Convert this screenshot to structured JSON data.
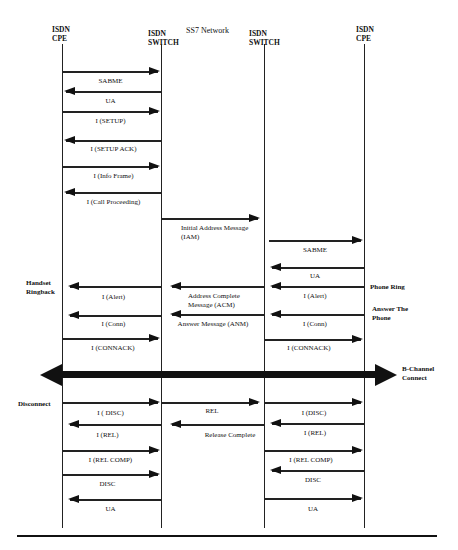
{
  "diagram": {
    "network_title": "SS7 Network",
    "entities": [
      {
        "id": "cpe-left",
        "line1": "ISDN",
        "line2": "CPE"
      },
      {
        "id": "switch-left",
        "line1": "ISDN",
        "line2": "SWITCH"
      },
      {
        "id": "switch-right",
        "line1": "ISDN",
        "line2": "SWITCH"
      },
      {
        "id": "cpe-right",
        "line1": "ISDN",
        "line2": "CPE"
      }
    ],
    "messages": [
      {
        "label": "SABME",
        "from": "cpe-left",
        "to": "switch-left"
      },
      {
        "label": "UA",
        "from": "switch-left",
        "to": "cpe-left"
      },
      {
        "label": "I (SETUP)",
        "from": "cpe-left",
        "to": "switch-left"
      },
      {
        "label": "I (SETUP ACK)",
        "from": "switch-left",
        "to": "cpe-left"
      },
      {
        "label": "I (Info Frame)",
        "from": "cpe-left",
        "to": "switch-left"
      },
      {
        "label": "I (Call Proceeding)",
        "from": "switch-left",
        "to": "cpe-left"
      },
      {
        "label": "Initial Address Message (IAM)",
        "from": "switch-left",
        "to": "switch-right"
      },
      {
        "label": "SABME",
        "from": "switch-right",
        "to": "cpe-right"
      },
      {
        "label": "UA",
        "from": "cpe-right",
        "to": "switch-right"
      },
      {
        "label": "I (Alert)",
        "from": "cpe-right",
        "to": "switch-right"
      },
      {
        "label": "Address Complete Message (ACM)",
        "from": "switch-right",
        "to": "switch-left"
      },
      {
        "label": "I (Alert)",
        "from": "switch-left",
        "to": "cpe-left"
      },
      {
        "label": "I (Conn)",
        "from": "cpe-right",
        "to": "switch-right"
      },
      {
        "label": "Answer Message (ANM)",
        "from": "switch-right",
        "to": "switch-left"
      },
      {
        "label": "I (Conn)",
        "from": "switch-left",
        "to": "cpe-left"
      },
      {
        "label": "I (CONNACK)",
        "from": "cpe-left",
        "to": "switch-left"
      },
      {
        "label": "I (CONNACK)",
        "from": "switch-right",
        "to": "cpe-right"
      },
      {
        "label": "I ( DISC)",
        "from": "cpe-left",
        "to": "switch-left"
      },
      {
        "label": "REL",
        "from": "switch-left",
        "to": "switch-right"
      },
      {
        "label": "I (DISC)",
        "from": "switch-right",
        "to": "cpe-right"
      },
      {
        "label": "I (REL)",
        "from": "switch-left",
        "to": "cpe-left"
      },
      {
        "label": "Release Complete",
        "from": "switch-right",
        "to": "switch-left"
      },
      {
        "label": "I (REL)",
        "from": "cpe-right",
        "to": "switch-right"
      },
      {
        "label": "I (REL COMP)",
        "from": "cpe-left",
        "to": "switch-left"
      },
      {
        "label": "I (REL COMP)",
        "from": "switch-right",
        "to": "cpe-right"
      },
      {
        "label": "DISC",
        "from": "cpe-left",
        "to": "switch-left"
      },
      {
        "label": "DISC",
        "from": "cpe-right",
        "to": "switch-right"
      },
      {
        "label": "UA",
        "from": "switch-left",
        "to": "cpe-left"
      },
      {
        "label": "UA",
        "from": "switch-right",
        "to": "cpe-right"
      }
    ],
    "side_notes": {
      "handset_ringback": [
        "Handset",
        "Ringback"
      ],
      "phone_ring": "Phone Ring",
      "answer_the_phone": [
        "Answer The",
        "Phone"
      ],
      "b_channel_connect": [
        "B-Channel",
        "Connect"
      ],
      "disconnect": "Disconnect"
    },
    "b_channel": {
      "label": "B-Channel Connect",
      "direction": "bidirectional"
    }
  }
}
